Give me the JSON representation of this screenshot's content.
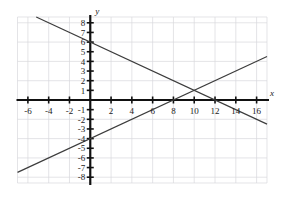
{
  "chart_data": {
    "type": "line",
    "title": "",
    "xlabel": "x",
    "ylabel": "y",
    "xlim": [
      -7,
      17
    ],
    "ylim": [
      -8.6,
      8.6
    ],
    "grid": true,
    "legend": "none",
    "x_ticks": [
      -6,
      -4,
      -2,
      2,
      4,
      6,
      8,
      10,
      12,
      14,
      16
    ],
    "x_tick_labels": [
      "-6",
      "-4",
      "-2",
      "2",
      "4",
      "6",
      "8",
      "10",
      "12",
      "14",
      "16"
    ],
    "y_ticks": [
      8,
      7,
      6,
      5,
      4,
      3,
      2,
      1,
      -1,
      -2,
      -3,
      -4,
      -5,
      -6,
      -7,
      -8
    ],
    "y_tick_labels": [
      "8",
      "7",
      "6",
      "5",
      "4",
      "3",
      "2",
      "1",
      "-1",
      "-2",
      "-3",
      "-4",
      "-5",
      "-6",
      "-7",
      "-8"
    ],
    "grid_x_step": 2,
    "grid_y_step": 2,
    "series": [
      {
        "name": "ascending-line",
        "slope": 0.5,
        "y_intercept": -4,
        "x_intercept": 8,
        "points": [
          [
            -6,
            -7
          ],
          [
            0,
            -4
          ],
          [
            8,
            0
          ],
          [
            10,
            1
          ],
          [
            16,
            4
          ]
        ],
        "color": "#3c3c3c"
      },
      {
        "name": "descending-line",
        "slope": -0.5,
        "y_intercept": 6,
        "x_intercept": 12,
        "points": [
          [
            -4,
            8
          ],
          [
            0,
            6
          ],
          [
            10,
            1
          ],
          [
            12,
            0
          ],
          [
            16,
            -2
          ]
        ],
        "color": "#3c3c3c"
      }
    ],
    "intersection": [
      10,
      1
    ],
    "annotations": []
  },
  "axes": {
    "x_axis_label": "x",
    "y_axis_label": "y"
  }
}
